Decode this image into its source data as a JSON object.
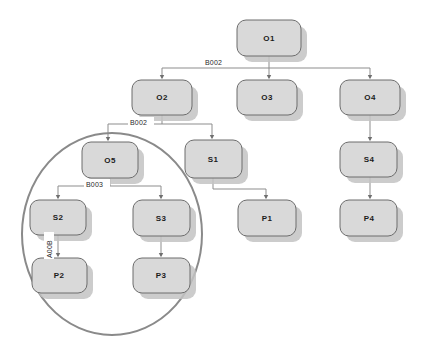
{
  "diagram": {
    "colors": {
      "node_fill": "#d9d9d9",
      "node_stroke": "#6d6d6d",
      "node_shadow": "#c3c3c3",
      "edge_stroke": "#8d8d8d",
      "group_stroke": "#8a8a8a",
      "label_text": "#1b1b1b",
      "background": "#ffffff"
    },
    "nodes": [
      {
        "id": "O1",
        "label": "O1",
        "x": 237,
        "y": 20,
        "w": 64,
        "h": 36
      },
      {
        "id": "O2",
        "label": "O2",
        "x": 132,
        "y": 80,
        "w": 60,
        "h": 35
      },
      {
        "id": "O3",
        "label": "O3",
        "x": 237,
        "y": 80,
        "w": 60,
        "h": 35
      },
      {
        "id": "O4",
        "label": "O4",
        "x": 340,
        "y": 80,
        "w": 60,
        "h": 35
      },
      {
        "id": "O5",
        "label": "O5",
        "x": 82,
        "y": 142,
        "w": 56,
        "h": 36
      },
      {
        "id": "S1",
        "label": "S1",
        "x": 185,
        "y": 140,
        "w": 57,
        "h": 38
      },
      {
        "id": "S4",
        "label": "S4",
        "x": 340,
        "y": 142,
        "w": 57,
        "h": 35
      },
      {
        "id": "S2",
        "label": "S2",
        "x": 30,
        "y": 200,
        "w": 56,
        "h": 35
      },
      {
        "id": "S3",
        "label": "S3",
        "x": 133,
        "y": 200,
        "w": 57,
        "h": 36
      },
      {
        "id": "P1",
        "label": "P1",
        "x": 238,
        "y": 200,
        "w": 58,
        "h": 36
      },
      {
        "id": "P4",
        "label": "P4",
        "x": 340,
        "y": 200,
        "w": 57,
        "h": 36
      },
      {
        "id": "P2",
        "label": "P2",
        "x": 32,
        "y": 258,
        "w": 55,
        "h": 35
      },
      {
        "id": "P3",
        "label": "P3",
        "x": 133,
        "y": 258,
        "w": 57,
        "h": 35
      }
    ],
    "edge_labels": [
      {
        "id": "edge-label-o1-bus",
        "text": "B002",
        "x": 205,
        "y": 64
      },
      {
        "id": "edge-label-o2-bus",
        "text": "B002",
        "x": 130,
        "y": 124
      },
      {
        "id": "edge-label-o5-bus",
        "text": "B003",
        "x": 86,
        "y": 186
      },
      {
        "id": "edge-label-s2-p2",
        "text": "A00B",
        "x": 48,
        "y": 246,
        "rotated": true
      }
    ],
    "edges": [
      {
        "from": "O1",
        "to": "O2",
        "label": "B002"
      },
      {
        "from": "O1",
        "to": "O3",
        "label": "B002"
      },
      {
        "from": "O1",
        "to": "O4",
        "label": "B002"
      },
      {
        "from": "O2",
        "to": "O5",
        "label": "B002"
      },
      {
        "from": "O2",
        "to": "S1",
        "label": "B002"
      },
      {
        "from": "O4",
        "to": "S4",
        "label": ""
      },
      {
        "from": "O5",
        "to": "S2",
        "label": "B003"
      },
      {
        "from": "O5",
        "to": "S3",
        "label": "B003"
      },
      {
        "from": "S1",
        "to": "P1",
        "label": ""
      },
      {
        "from": "S4",
        "to": "P4",
        "label": ""
      },
      {
        "from": "S2",
        "to": "P2",
        "label": "A00B"
      },
      {
        "from": "S3",
        "to": "P3",
        "label": ""
      }
    ],
    "group": {
      "id": "selection-ellipse",
      "cx": 112,
      "cy": 234,
      "rx": 90,
      "ry": 101,
      "members": [
        "O5",
        "S2",
        "S3",
        "P2",
        "P3"
      ]
    }
  }
}
